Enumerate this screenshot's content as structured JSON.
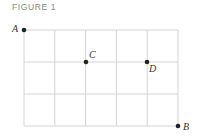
{
  "figure": {
    "title": "FIGURE 1",
    "grid": {
      "columns": 5,
      "rows": 3,
      "x0": 24,
      "y0": 30,
      "cell_w": 30.8,
      "cell_h": 32,
      "line_color": "#d4d4d4"
    },
    "points": [
      {
        "label": "A",
        "col": 0,
        "row": 0,
        "x": 24,
        "y": 30,
        "label_dx": -12,
        "label_dy": 2
      },
      {
        "label": "C",
        "col": 2,
        "row": 1,
        "x": 86,
        "y": 62,
        "label_dx": 3,
        "label_dy": -4
      },
      {
        "label": "D",
        "col": 4,
        "row": 1,
        "x": 147,
        "y": 62,
        "label_dx": 2,
        "label_dy": 10
      },
      {
        "label": "B",
        "col": 5,
        "row": 3,
        "x": 178,
        "y": 126,
        "label_dx": 5,
        "label_dy": 4
      }
    ],
    "point_color": "#222222"
  }
}
